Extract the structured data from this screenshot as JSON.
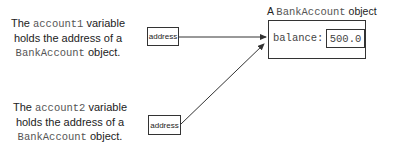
{
  "captions": [
    {
      "line1_prefix": "The ",
      "line1_code": "account1",
      "line1_suffix": " variable",
      "line2": "holds the address of a",
      "line3_code": "BankAccount",
      "line3_suffix": " object."
    },
    {
      "line1_prefix": "The ",
      "line1_code": "account2",
      "line1_suffix": " variable",
      "line2": "holds the address of a",
      "line3_code": "BankAccount",
      "line3_suffix": " object."
    }
  ],
  "address_boxes": [
    {
      "label": "address"
    },
    {
      "label": "address"
    }
  ],
  "object": {
    "title_prefix": "A ",
    "title_code": "BankAccount",
    "title_suffix": " object",
    "field_label": "balance:",
    "field_value": "500.0"
  },
  "colors": {
    "line": "#333333",
    "text": "#222222",
    "code": "#555555"
  }
}
